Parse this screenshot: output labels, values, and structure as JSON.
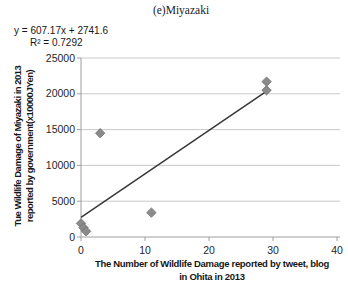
{
  "figure": {
    "caption": "(e)Miyazaki"
  },
  "chart_data": {
    "type": "scatter",
    "title": "(e)Miyazaki",
    "xlabel": "The Number of Wildlife Damage reported by tweet, blog in Ohita in 2013",
    "xlabel_lines": [
      "The Number of Wildlife Damage reported by tweet, blog",
      "in Ohita in 2013"
    ],
    "ylabel": "Tue Wildlife Damage of Miyazaki in 2013 reported by government(x10000JYen)",
    "ylabel_lines": [
      "Tue Wildlife Damage of Miyazaki in 2013",
      "reported by government(x10000JYen)"
    ],
    "points": [
      {
        "x": 0,
        "y": 1900
      },
      {
        "x": 0.4,
        "y": 1300
      },
      {
        "x": 0.8,
        "y": 800
      },
      {
        "x": 3,
        "y": 14500
      },
      {
        "x": 11,
        "y": 3400
      },
      {
        "x": 29,
        "y": 21700
      },
      {
        "x": 29,
        "y": 20500
      }
    ],
    "trendline": {
      "equation": "y = 607.17x + 2741.6",
      "slope": 607.17,
      "intercept": 2741.6,
      "r2_label": "R² = 0.7292",
      "r_squared": 0.7292,
      "x_range": [
        0,
        28.9
      ]
    },
    "x_ticks": [
      0,
      10,
      20,
      30,
      40
    ],
    "y_ticks": [
      0,
      5000,
      10000,
      15000,
      20000,
      25000
    ],
    "xlim": [
      0,
      40
    ],
    "ylim": [
      0,
      25000
    ],
    "grid": "horizontal-only",
    "legend": "none",
    "marker": "diamond",
    "colors": {
      "marker_fill": "#8b8b8b",
      "marker_stroke": "#6f6f6f",
      "trendline": "#383838",
      "gridline": "#c9c9c9",
      "axis": "#9e9e9e",
      "tick_text": "#1f1f1f"
    }
  }
}
